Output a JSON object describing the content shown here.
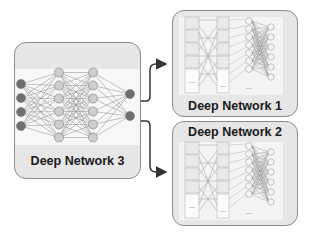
{
  "diagram": {
    "source_network": {
      "label": "Deep Network 3",
      "input_nodes": 4,
      "hidden_layers": [
        6,
        6
      ],
      "output_nodes": 2
    },
    "targets": [
      {
        "label": "Deep Network 1"
      },
      {
        "label": "Deep Network 2"
      }
    ],
    "block_marker": "...",
    "colors": {
      "box_fill": "#e6e6e6",
      "box_border": "#8c8c8c",
      "node_dark": "#6e6e6e",
      "node_light": "#cfcfcf",
      "arrow": "#333333"
    }
  }
}
